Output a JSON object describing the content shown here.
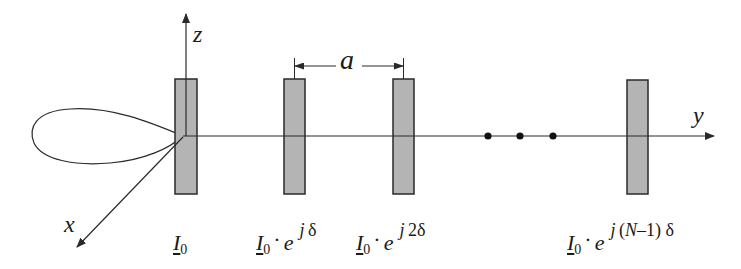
{
  "diagram": {
    "colors": {
      "line": "#2a2a2a",
      "dipole_fill": "#b4b4b4",
      "dipole_stroke": "#2a2a2a",
      "background": "#ffffff"
    },
    "axes": {
      "z": {
        "label": "z"
      },
      "y": {
        "label": "y"
      },
      "x": {
        "label": "x"
      }
    },
    "spacing": {
      "label": "a"
    },
    "continuation": {
      "symbol": "• • •",
      "count": 3
    },
    "radiation_pattern": {
      "shape": "single lobe toward -y (endfire)"
    },
    "elements": [
      {
        "index": 0,
        "base": "I",
        "sub": "0",
        "has_exp": false,
        "exp_j": "",
        "exp_rest": ""
      },
      {
        "index": 1,
        "base": "I",
        "sub": "0",
        "has_exp": true,
        "dot": "·",
        "e": "e",
        "exp_j": "j",
        "exp_rest": "δ"
      },
      {
        "index": 2,
        "base": "I",
        "sub": "0",
        "has_exp": true,
        "dot": "·",
        "e": "e",
        "exp_j": "j",
        "exp_rest": "2δ"
      },
      {
        "index": "N-1",
        "base": "I",
        "sub": "0",
        "has_exp": true,
        "dot": "·",
        "e": "e",
        "exp_j": "j",
        "exp_open": "(",
        "exp_N": "N",
        "exp_mid": "–1)",
        "exp_rest": " δ"
      }
    ]
  }
}
